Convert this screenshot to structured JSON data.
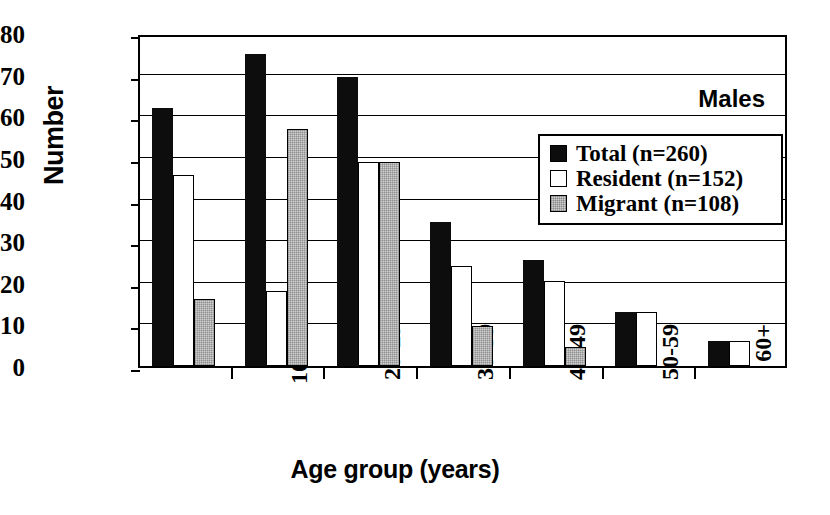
{
  "chart_data": {
    "type": "bar",
    "title": "",
    "annotation": "Males",
    "xlabel": "Age group (years)",
    "ylabel": "Number",
    "categories": [
      "0-9",
      "10–19",
      "20-29",
      "30-39",
      "40-49",
      "50-59",
      "60+"
    ],
    "series": [
      {
        "name": "Total (n=260)",
        "key": "total",
        "color": "#0d0d0d",
        "values": [
          62,
          75,
          69.5,
          34.5,
          25.5,
          13,
          6
        ]
      },
      {
        "name": "Resident (n=152)",
        "key": "resident",
        "color": "#ffffff",
        "values": [
          46,
          18,
          49,
          24,
          20.5,
          13,
          6
        ]
      },
      {
        "name": "Migrant (n=108)",
        "key": "migrant",
        "color": "#cfcfcf",
        "values": [
          16,
          57,
          49,
          9.5,
          4.5,
          0,
          0
        ]
      }
    ],
    "yticks": [
      0,
      10,
      20,
      30,
      40,
      50,
      60,
      70,
      80
    ],
    "ylim": [
      0,
      80
    ],
    "grid": true,
    "legend_position": "upper-right"
  },
  "axes": {
    "y_title": "Number",
    "x_title": "Age group (years)",
    "y_tick_labels": [
      "80",
      "70",
      "60",
      "50",
      "40",
      "30",
      "20",
      "10",
      "0"
    ],
    "x_tick_labels": [
      "0-9",
      "10–19",
      "20-29",
      "30-39",
      "40-49",
      "50-59",
      "60+"
    ]
  },
  "annotation": {
    "label": "Males"
  },
  "legend": {
    "items": [
      {
        "label": "Total (n=260)",
        "swatch": "black-swatch"
      },
      {
        "label": "Resident (n=152)",
        "swatch": "white-swatch"
      },
      {
        "label": "Migrant (n=108)",
        "swatch": "gray-swatch"
      }
    ]
  }
}
